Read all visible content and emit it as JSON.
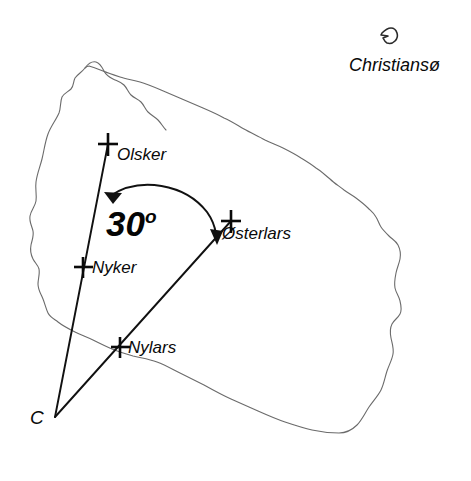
{
  "figure": {
    "kind": "annotated-map",
    "region_name": "Bornholm",
    "background_color": "#ffffff",
    "coastline_color": "#6b6b6b",
    "line_color": "#111111",
    "text_color": "#0a0a0a"
  },
  "places": [
    {
      "id": "olsker",
      "label": "Olsker",
      "marker": "cross-marker",
      "x": 108,
      "y": 144,
      "label_x": 117,
      "label_y": 153
    },
    {
      "id": "osterlars",
      "label": "Østerlars",
      "marker": "cross-marker",
      "x": 231,
      "y": 221,
      "label_x": 222,
      "label_y": 232
    },
    {
      "id": "nyker",
      "label": "Nyker",
      "marker": "cross-marker",
      "x": 83,
      "y": 267,
      "label_x": 92,
      "label_y": 258
    },
    {
      "id": "nylars",
      "label": "Nylars",
      "marker": "cross-marker",
      "x": 120,
      "y": 347,
      "label_x": 128,
      "label_y": 338
    }
  ],
  "vertex": {
    "id": "vertex-c",
    "label": "C",
    "x": 55,
    "y": 417,
    "label_x": 30,
    "label_y": 415
  },
  "angle": {
    "value": "30",
    "degree_symbol": "o",
    "full_text": "30°",
    "label_x": 108,
    "label_y": 206,
    "arrow_style": "double-headed-curved"
  },
  "islet": {
    "label": "Christiansø",
    "label_x": 349,
    "label_y": 56,
    "shape_x": 389,
    "shape_y": 28
  },
  "rays": [
    {
      "id": "ray-c-olsker",
      "from": "vertex-c",
      "to": "olsker"
    },
    {
      "id": "ray-c-osterlars",
      "from": "vertex-c",
      "to": "osterlars"
    }
  ]
}
